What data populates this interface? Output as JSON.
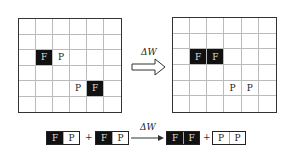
{
  "left_grid": {
    "rows": 6,
    "cols": 6,
    "cells": [
      {
        "row": 2,
        "col": 1,
        "type": "F",
        "label": "F"
      },
      {
        "row": 2,
        "col": 2,
        "type": "P",
        "label": "P"
      },
      {
        "row": 4,
        "col": 3,
        "type": "P",
        "label": "P"
      },
      {
        "row": 4,
        "col": 4,
        "type": "F",
        "label": "F"
      }
    ]
  },
  "right_grid": {
    "rows": 6,
    "cols": 6,
    "cells": [
      {
        "row": 2,
        "col": 1,
        "type": "F",
        "label": "F"
      },
      {
        "row": 2,
        "col": 2,
        "type": "F",
        "label": "F"
      },
      {
        "row": 4,
        "col": 3,
        "type": "P",
        "label": "P"
      },
      {
        "row": 4,
        "col": 4,
        "type": "P",
        "label": "P"
      }
    ]
  },
  "transition_arrow": {
    "label": "ΔW"
  },
  "equation": {
    "terms": [
      {
        "left": "F",
        "right": "P"
      },
      {
        "left": "F",
        "right": "P"
      },
      {
        "left": "F",
        "right": "F"
      },
      {
        "left": "P",
        "right": "P"
      }
    ],
    "plus": "+",
    "arrow_label": "ΔW"
  }
}
